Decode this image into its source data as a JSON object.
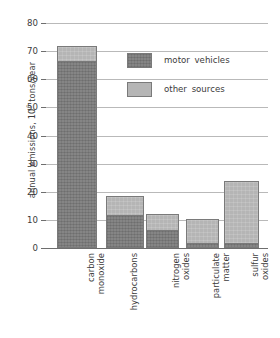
{
  "chart_data": {
    "type": "bar",
    "subtype": "stacked-vertical",
    "title": "",
    "xlabel": "",
    "ylabel": "annual emissions, 10⁶ tons/year",
    "ylabel_prefix": "annual emissions, 10",
    "ylabel_exponent": "6",
    "ylabel_suffix": " tons/year",
    "ylim": [
      0,
      80
    ],
    "ytick_labels": [
      "80",
      "70",
      "60",
      "50",
      "40",
      "30",
      "20",
      "10",
      "0"
    ],
    "ytick_values": [
      80,
      70,
      60,
      50,
      40,
      30,
      20,
      10,
      0
    ],
    "ytick_step": 10,
    "grid": "horizontal",
    "categories": [
      "carbon monoxide",
      "hydrocarbons",
      "nitrogen oxides",
      "particulate matter",
      "sulfur oxides"
    ],
    "category_lines": [
      [
        "carbon",
        "monoxide"
      ],
      [
        "hydrocarbons",
        ""
      ],
      [
        "nitrogen",
        "oxides"
      ],
      [
        "particulate",
        "matter"
      ],
      [
        "sulfur",
        "oxides"
      ]
    ],
    "series": [
      {
        "name": "motor vehicles",
        "color": "#858585",
        "values": [
          66,
          11.4,
          6,
          1.4,
          1.4
        ]
      },
      {
        "name": "other sources",
        "color": "#b5b5b5",
        "values": [
          6,
          7.1,
          6,
          8.9,
          22.6
        ]
      }
    ],
    "totals": [
      72,
      18.5,
      12,
      10.3,
      24
    ],
    "legend": {
      "position": "inside-top-right",
      "entries": [
        {
          "label": "motor vehicles",
          "swatch": "motor",
          "color": "#858585"
        },
        {
          "label": "other sources",
          "swatch": "other",
          "color": "#b5b5b5"
        }
      ]
    },
    "colors": {
      "motor_vehicles": "#858585",
      "other_sources": "#b5b5b5",
      "gridline": "#b9b9b9",
      "axis": "#6e6e6e",
      "text": "#3b3b3b",
      "background": "#ffffff"
    }
  }
}
